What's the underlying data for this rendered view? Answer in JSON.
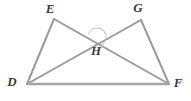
{
  "figure": {
    "background_color": "#ffffff",
    "line_color": "#9a9a9a",
    "label_color": "#3a3a3a",
    "arc_color": "#c4c4c4",
    "width": 191,
    "height": 101
  },
  "points": {
    "E": {
      "label": "E",
      "x": 54,
      "y": 19,
      "label_x": 50,
      "label_y": 10
    },
    "G": {
      "label": "G",
      "x": 141,
      "y": 20,
      "label_x": 138,
      "label_y": 9
    },
    "D": {
      "label": "D",
      "x": 27,
      "y": 84,
      "label_x": 12,
      "label_y": 83
    },
    "F": {
      "label": "F",
      "x": 169,
      "y": 84,
      "label_x": 178,
      "label_y": 84
    },
    "H": {
      "label": "H",
      "x": 97,
      "y": 37,
      "label_x": 96,
      "label_y": 52
    }
  },
  "segments": [
    {
      "name": "segment-DE",
      "from": "D",
      "to": "E"
    },
    {
      "name": "segment-EF",
      "from": "E",
      "to": "F"
    },
    {
      "name": "segment-DG",
      "from": "D",
      "to": "G"
    },
    {
      "name": "segment-GF",
      "from": "G",
      "to": "F"
    },
    {
      "name": "segment-DF",
      "from": "D",
      "to": "F"
    }
  ],
  "angle_marks": [
    {
      "name": "angle-arc-top",
      "cx": 97,
      "cy": 37,
      "radius": 9,
      "start_deg": 200,
      "end_deg": 340
    },
    {
      "name": "angle-arc-right",
      "cx": 97,
      "cy": 37,
      "radius": 9,
      "start_deg": 290,
      "end_deg": 70
    }
  ]
}
